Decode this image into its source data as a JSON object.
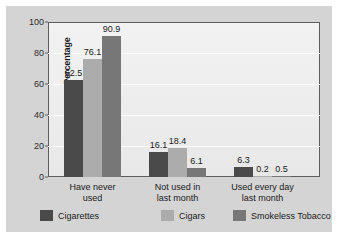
{
  "chart_data": {
    "type": "bar",
    "title": "",
    "xlabel": "",
    "ylabel": "Percentage",
    "ylim": [
      0,
      100
    ],
    "yticks": [
      0,
      20,
      40,
      60,
      80,
      100
    ],
    "grid": true,
    "legend_position": "bottom",
    "categories": [
      "Have never used",
      "Not used in last month",
      "Used every day last month"
    ],
    "category_lines": [
      [
        "Have never",
        "used"
      ],
      [
        "Not used in",
        "last month"
      ],
      [
        "Used every day",
        "last month"
      ]
    ],
    "series": [
      {
        "name": "Cigarettes",
        "color": "#4a4a4a",
        "values": [
          62.5,
          16.1,
          6.3
        ]
      },
      {
        "name": "Cigars",
        "color": "#acacac",
        "values": [
          76.1,
          18.4,
          0.2
        ]
      },
      {
        "name": "Smokeless Tobacco",
        "color": "#777777",
        "values": [
          90.9,
          6.1,
          0.5
        ]
      }
    ],
    "value_labels": [
      "62.5",
      "76.1",
      "90.9",
      "16.1",
      "18.4",
      "6.1",
      "6.3",
      "0.2",
      "0.5"
    ]
  },
  "legend": {
    "items": [
      {
        "label": "Cigarettes",
        "color": "#4a4a4a"
      },
      {
        "label": "Cigars",
        "color": "#acacac"
      },
      {
        "label": "Smokeless Tobacco",
        "color": "#777777"
      }
    ]
  }
}
